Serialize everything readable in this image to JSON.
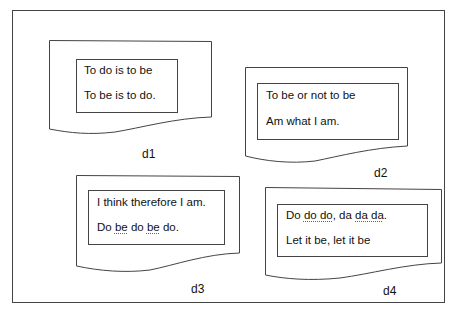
{
  "documents": [
    {
      "id": "d1",
      "label": "d1",
      "lines": [
        {
          "segments": [
            {
              "text": "To do is to be",
              "underline": false
            }
          ]
        },
        {
          "segments": [
            {
              "text": "To be is to do.",
              "underline": false
            }
          ]
        }
      ]
    },
    {
      "id": "d2",
      "label": "d2",
      "lines": [
        {
          "segments": [
            {
              "text": "To be or not to be",
              "underline": false
            }
          ]
        },
        {
          "segments": [
            {
              "text": "Am what I am.",
              "underline": false
            }
          ]
        }
      ]
    },
    {
      "id": "d3",
      "label": "d3",
      "lines": [
        {
          "segments": [
            {
              "text": "I think therefore I am.",
              "underline": false
            }
          ]
        },
        {
          "segments": [
            {
              "text": "Do ",
              "underline": false
            },
            {
              "text": "be",
              "underline": true
            },
            {
              "text": " do ",
              "underline": false
            },
            {
              "text": "be",
              "underline": true
            },
            {
              "text": " do.",
              "underline": false
            }
          ]
        }
      ]
    },
    {
      "id": "d4",
      "label": "d4",
      "lines": [
        {
          "segments": [
            {
              "text": "Do ",
              "underline": false
            },
            {
              "text": "do do",
              "underline": true
            },
            {
              "text": ", da ",
              "underline": false
            },
            {
              "text": "da da",
              "underline": true
            },
            {
              "text": ".",
              "underline": false
            }
          ]
        },
        {
          "segments": [
            {
              "text": "Let it be, let it be",
              "underline": false
            }
          ]
        }
      ]
    }
  ],
  "colors": {
    "stroke": "#333333",
    "background": "#ffffff",
    "text": "#111111"
  }
}
